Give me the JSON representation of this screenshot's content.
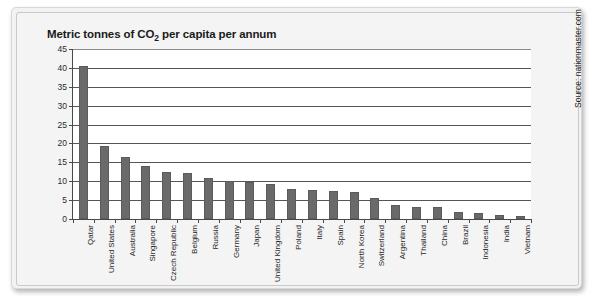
{
  "chart_data": {
    "type": "bar",
    "title": "Metric tonnes of CO2 per capita per annum",
    "title_prefix": "Metric tonnes of CO",
    "title_sub": "2",
    "title_suffix": " per capita per annum",
    "xlabel": "",
    "ylabel": "",
    "ylim": [
      0,
      45
    ],
    "ytick_step": 5,
    "yticks": [
      0,
      5,
      10,
      15,
      20,
      25,
      30,
      35,
      40,
      45
    ],
    "ytick_labels": [
      "0",
      "5",
      "10",
      "15",
      "20",
      "25",
      "30",
      "35",
      "40",
      "45"
    ],
    "grid": true,
    "legend": "none",
    "bar_color": "#6a6a6a",
    "categories": [
      "Qatar",
      "United States",
      "Australia",
      "Singapore",
      "Czech Republic",
      "Belgium",
      "Russia",
      "Germany",
      "Japan",
      "United Kingdom",
      "Poland",
      "Italy",
      "Spain",
      "North Korea",
      "Switzerland",
      "Argentina",
      "Thailand",
      "China",
      "Brazil",
      "Indonesia",
      "India",
      "Vietnam"
    ],
    "values": [
      40.5,
      19.3,
      16.3,
      14.0,
      12.4,
      12.2,
      10.8,
      10.1,
      9.9,
      9.4,
      8.0,
      7.7,
      7.5,
      7.2,
      5.6,
      3.8,
      3.3,
      3.2,
      1.9,
      1.5,
      1.1,
      0.9
    ]
  },
  "source": {
    "text": "Source: nationmaster.com"
  }
}
